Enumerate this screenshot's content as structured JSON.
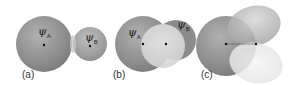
{
  "panels": [
    {
      "id": "a",
      "label": "(a)",
      "orbital_labels": [
        "ψ",
        "ψ"
      ],
      "subscripts": [
        "A",
        "B"
      ]
    },
    {
      "id": "b",
      "label": "(b)",
      "orbital_labels": [
        "ψ",
        "ψ"
      ],
      "subscripts": [
        "A",
        "B"
      ]
    },
    {
      "id": "c",
      "label": "(c)"
    }
  ],
  "colors": {
    "sphere_dark": "#8a8a8a",
    "sphere_mid": "#a5a5a5",
    "sphere_light": "#d4d4d4",
    "overlap_light": "#e6e6e6",
    "nucleus": "#111111"
  }
}
